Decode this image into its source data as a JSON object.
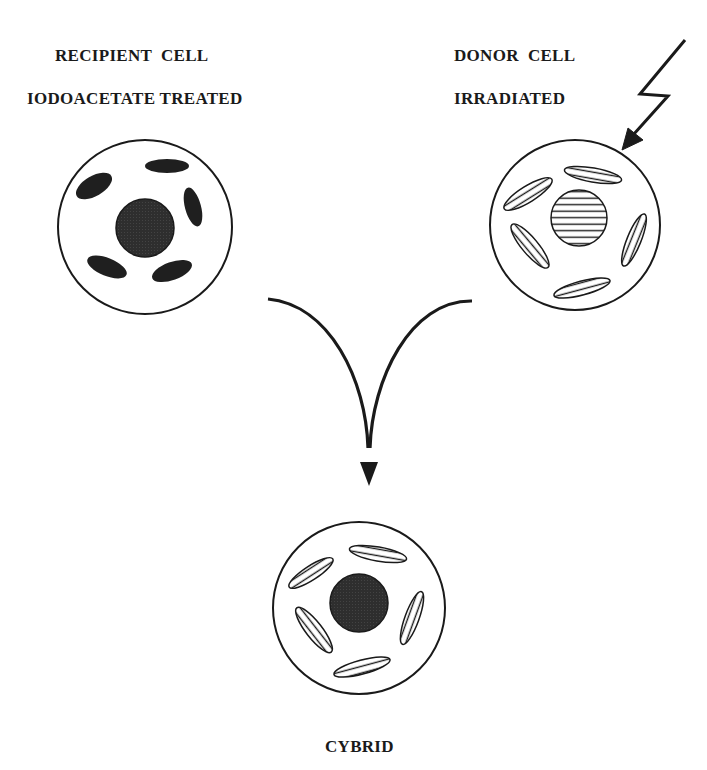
{
  "diagram": {
    "recipient": {
      "line1": "RECIPIENT  CELL",
      "line2": "IODOACETATE TREATED",
      "nucleus": "dense",
      "mitochondria": "dense"
    },
    "donor": {
      "line1": "DONOR  CELL",
      "line2": "IRRADIATED",
      "nucleus": "hatched",
      "mitochondria": "hatched"
    },
    "result": {
      "label": "CYBRID",
      "nucleus": "dense",
      "mitochondria": "hatched"
    },
    "arrows": [
      {
        "from": "recipient",
        "to": "result"
      },
      {
        "from": "donor",
        "to": "result"
      },
      {
        "from": "radiation",
        "to": "donor",
        "style": "lightning"
      }
    ],
    "colors": {
      "ink": "#1a1a1a",
      "dense_fill": "#2b2b2b",
      "background": "#ffffff"
    }
  }
}
